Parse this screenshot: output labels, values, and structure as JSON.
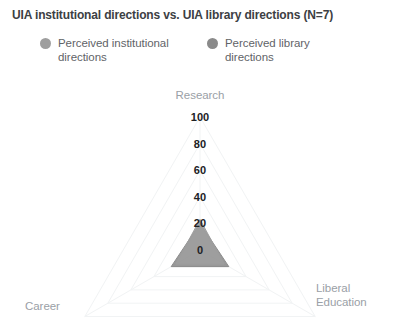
{
  "title": "UIA institutional directions vs. UIA library directions (N=7)",
  "legend": {
    "items": [
      {
        "label": "Perceived institutional directions",
        "color": "#9e9e9e",
        "name": "legend-item-perceived-institutional-directions"
      },
      {
        "label": "Perceived library directions",
        "color": "#8a8a8a",
        "name": "legend-item-perceived-library-directions"
      }
    ]
  },
  "axis_labels": {
    "research": "Research",
    "career": "Career",
    "liberal_education": "Liberal\nEducation"
  },
  "ticks": {
    "t0": "0",
    "t20": "20",
    "t40": "40",
    "t60": "60",
    "t80": "80",
    "t100": "100"
  },
  "chart_data": {
    "type": "radar",
    "title": "UIA institutional directions vs. UIA library directions (N=7)",
    "categories": [
      "Research",
      "Liberal Education",
      "Career"
    ],
    "tick_values": [
      0,
      20,
      40,
      60,
      80,
      100
    ],
    "rlim": [
      0,
      100
    ],
    "grid": true,
    "legend_position": "top",
    "series": [
      {
        "name": "Perceived institutional directions",
        "color": "#9e9e9e",
        "values": [
          23,
          21,
          21
        ]
      },
      {
        "name": "Perceived library directions",
        "color": "#8a8a8a",
        "values": [
          20,
          25,
          25
        ]
      }
    ]
  },
  "geometry": {
    "center_x": 200,
    "center_y": 250,
    "radius_100": 133
  }
}
